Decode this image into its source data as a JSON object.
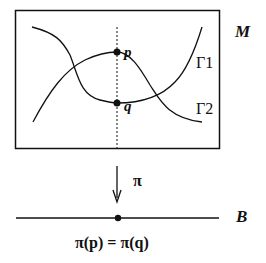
{
  "labels": {
    "manifold": "M",
    "base": "B",
    "curve1": "Γ1",
    "curve2": "Γ2",
    "point_p": "p",
    "point_q": "q",
    "projection": "π",
    "equation": "π(p) = π(q)"
  },
  "colors": {
    "ink": "#111111",
    "background": "#ffffff"
  }
}
